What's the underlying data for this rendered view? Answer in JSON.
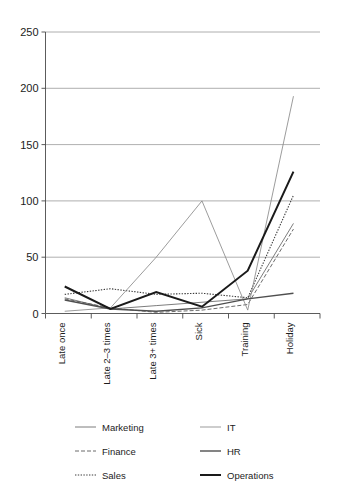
{
  "chart_data": {
    "type": "line",
    "title": "",
    "subtitle": "",
    "xlabel": "",
    "ylabel": "",
    "ylim": [
      0,
      250
    ],
    "yticks": [
      0,
      50,
      100,
      150,
      200,
      250
    ],
    "ytick_labels": [
      "0",
      "50",
      "100",
      "150",
      "200",
      "250"
    ],
    "grid": true,
    "legend_position": "bottom",
    "categories": [
      "Late once",
      "Late 2–3 times",
      "Late 3+ times",
      "Sick",
      "Training",
      "Holiday"
    ],
    "series": [
      {
        "name": "Marketing",
        "style": "solid-thin",
        "color": "#6e6e6e",
        "width": 0.9,
        "dash": "none",
        "values": [
          14,
          4,
          7,
          10,
          13,
          80
        ]
      },
      {
        "name": "Finance",
        "style": "dashed",
        "color": "#5a5a5a",
        "width": 0.9,
        "dash": "4,2",
        "values": [
          13,
          5,
          1,
          3,
          8,
          75
        ]
      },
      {
        "name": "Sales",
        "style": "dotted",
        "color": "#3c3c3c",
        "width": 1.1,
        "dash": "1.4,1.4",
        "values": [
          17,
          22,
          17,
          18,
          14,
          105
        ]
      },
      {
        "name": "IT",
        "style": "solid-thin-light",
        "color": "#8a8a8a",
        "width": 0.85,
        "dash": "none",
        "values": [
          2,
          5,
          50,
          100,
          3,
          193
        ]
      },
      {
        "name": "HR",
        "style": "solid-medium",
        "color": "#4f4f4f",
        "width": 1.4,
        "dash": "none",
        "values": [
          12,
          4,
          2,
          5,
          13,
          18
        ]
      },
      {
        "name": "Operations",
        "style": "solid-thick",
        "color": "#1a1a1a",
        "width": 2.0,
        "dash": "none",
        "values": [
          24,
          4,
          19,
          6,
          38,
          126
        ]
      }
    ],
    "legend": [
      {
        "label": "Marketing",
        "column": "left",
        "row": 0
      },
      {
        "label": "Finance",
        "column": "left",
        "row": 1
      },
      {
        "label": "Sales",
        "column": "left",
        "row": 2
      },
      {
        "label": "IT",
        "column": "right",
        "row": 0
      },
      {
        "label": "HR",
        "column": "right",
        "row": 1
      },
      {
        "label": "Operations",
        "column": "right",
        "row": 2
      }
    ]
  },
  "colors": {
    "background": "#ffffff",
    "grid": "#9a9a9a",
    "axis": "#4a4a4a",
    "text": "#1c1c1c"
  }
}
